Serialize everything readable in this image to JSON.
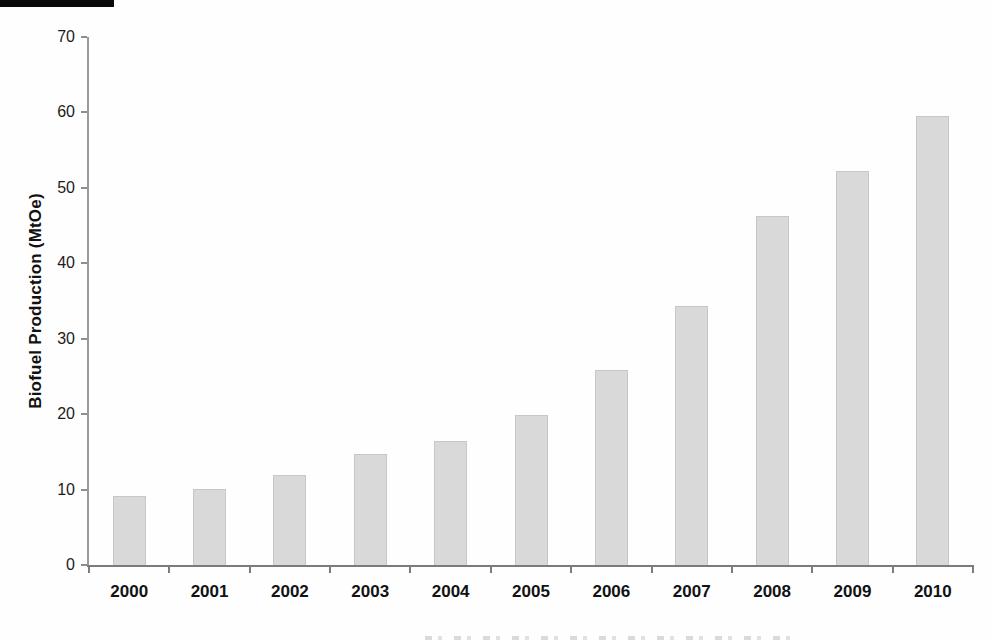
{
  "chart_data": {
    "type": "bar",
    "title": "",
    "xlabel": "",
    "ylabel": "Biofuel Production (MtOe)",
    "categories": [
      "2000",
      "2001",
      "2002",
      "2003",
      "2004",
      "2005",
      "2006",
      "2007",
      "2008",
      "2009",
      "2010"
    ],
    "values": [
      9.2,
      10.1,
      11.9,
      14.7,
      16.4,
      19.9,
      25.8,
      34.4,
      46.3,
      52.3,
      59.5
    ],
    "ylim": [
      0,
      70
    ],
    "yticks": [
      0,
      10,
      20,
      30,
      40,
      50,
      60,
      70
    ],
    "grid": "off",
    "legend": "none",
    "colors": {
      "bar_fill": "#d9d9d9",
      "bar_border": "#c7c7c7",
      "axis": "#7b7b7b",
      "text": "#161616"
    }
  }
}
